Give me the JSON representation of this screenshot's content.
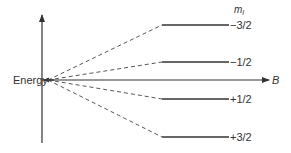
{
  "diagram": {
    "type": "energy-level-splitting",
    "axes": {
      "vertical_label": "Energy",
      "horizontal_label": "B"
    },
    "column_header": "m",
    "column_header_subscript": "I",
    "levels": [
      {
        "label": "−3/2",
        "y": 25
      },
      {
        "label": "−1/2",
        "y": 62
      },
      {
        "label": "+1/2",
        "y": 99
      },
      {
        "label": "+3/2",
        "y": 137
      }
    ],
    "colors": {
      "line": "#333333",
      "background": "#ffffff"
    }
  }
}
